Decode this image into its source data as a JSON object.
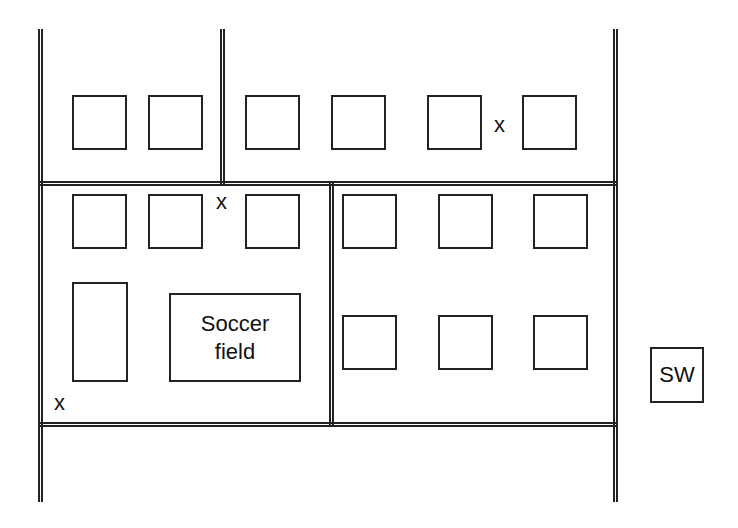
{
  "map": {
    "roads": {
      "vertical": [
        {
          "id": "left",
          "x": 38,
          "y": 29,
          "h": 473
        },
        {
          "id": "middle-top",
          "x": 220,
          "y": 29,
          "h": 156
        },
        {
          "id": "middle-lower",
          "x": 329,
          "y": 183,
          "h": 242
        },
        {
          "id": "right",
          "x": 613,
          "y": 29,
          "h": 473
        }
      ],
      "horizontal": [
        {
          "id": "upper",
          "x": 38,
          "y": 181,
          "w": 580
        },
        {
          "id": "lower",
          "x": 38,
          "y": 422,
          "w": 580
        }
      ]
    },
    "blocks": {
      "row1": [
        {
          "x": 72,
          "y": 95,
          "w": 55,
          "h": 55
        },
        {
          "x": 148,
          "y": 95,
          "w": 55,
          "h": 55
        },
        {
          "x": 245,
          "y": 95,
          "w": 55,
          "h": 55
        },
        {
          "x": 331,
          "y": 95,
          "w": 55,
          "h": 55
        },
        {
          "x": 427,
          "y": 95,
          "w": 55,
          "h": 55
        },
        {
          "x": 522,
          "y": 95,
          "w": 55,
          "h": 55
        }
      ],
      "row2": [
        {
          "x": 72,
          "y": 194,
          "w": 55,
          "h": 55
        },
        {
          "x": 148,
          "y": 194,
          "w": 55,
          "h": 55
        },
        {
          "x": 245,
          "y": 194,
          "w": 55,
          "h": 55
        },
        {
          "x": 342,
          "y": 194,
          "w": 55,
          "h": 55
        },
        {
          "x": 438,
          "y": 194,
          "w": 55,
          "h": 55
        },
        {
          "x": 533,
          "y": 194,
          "w": 55,
          "h": 55
        }
      ],
      "row3": [
        {
          "x": 342,
          "y": 315,
          "w": 55,
          "h": 55
        },
        {
          "x": 438,
          "y": 315,
          "w": 55,
          "h": 55
        },
        {
          "x": 533,
          "y": 315,
          "w": 55,
          "h": 55
        }
      ],
      "tall": {
        "x": 72,
        "y": 282,
        "w": 56,
        "h": 100
      }
    },
    "soccer_field": {
      "line1": "Soccer",
      "line2": "field"
    },
    "sw_box": {
      "label": "SW"
    },
    "marks": [
      {
        "label": "x",
        "x": 494,
        "y": 114
      },
      {
        "label": "x",
        "x": 216,
        "y": 191
      },
      {
        "label": "x",
        "x": 54,
        "y": 392
      }
    ]
  }
}
